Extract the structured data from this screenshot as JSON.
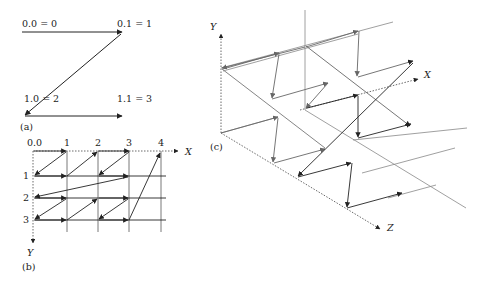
{
  "panel_a": {
    "caption": "(a)",
    "labels": {
      "p00": "0.0 = 0",
      "p01": "0.1 = 1",
      "p10": "1.0 = 2",
      "p11": "1.1 = 3"
    }
  },
  "panel_b": {
    "caption": "(b)",
    "x_axis_label": "X",
    "y_axis_label": "Y",
    "origin_label": "0.0",
    "col_labels": [
      "1",
      "2",
      "3",
      "4"
    ],
    "row_labels": [
      "1",
      "2",
      "3"
    ]
  },
  "panel_c": {
    "caption": "(c)",
    "x_axis_label": "X",
    "y_axis_label": "Y",
    "z_axis_label": "Z"
  },
  "colors": {
    "ink": "#222222",
    "gray": "#777777",
    "light_gray": "#999999"
  }
}
